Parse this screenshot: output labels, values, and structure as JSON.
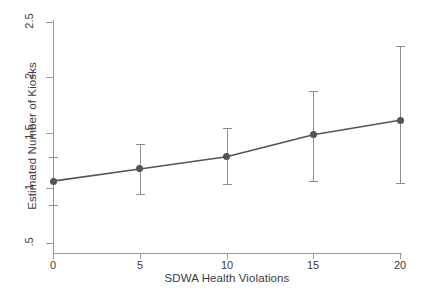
{
  "chart_data": {
    "type": "line",
    "title": "",
    "xlabel": "SDWA Health Violations",
    "ylabel": "Estimated Number of Kiosks",
    "x": [
      0,
      5,
      10,
      15,
      20
    ],
    "values": [
      1.06,
      1.17,
      1.28,
      1.48,
      1.61
    ],
    "series": [
      {
        "name": "Estimated Number of Kiosks",
        "values": [
          1.06,
          1.17,
          1.28,
          1.48,
          1.61
        ],
        "ci_lower": [
          0.84,
          0.94,
          1.03,
          1.06,
          1.04
        ],
        "ci_upper": [
          1.28,
          1.4,
          1.54,
          1.88,
          2.28
        ]
      }
    ],
    "xticklabels": [
      "0",
      "5",
      "10",
      "15",
      "20"
    ],
    "yticklabels": [
      "2.5",
      "2",
      "1.5",
      "1",
      ".5"
    ],
    "ytickvalues": [
      2.5,
      2,
      1.5,
      1,
      0.5
    ],
    "xlim": [
      0,
      20
    ],
    "ylim": [
      0.5,
      2.5
    ],
    "grid": false,
    "legend": "none",
    "marker": "filled-circle",
    "errorbars": "vertical-capped",
    "colors": {
      "line": "#545454",
      "marker": "#545454",
      "errorbar": "#8e8e8e",
      "axis": "#9a9a9a",
      "text": "#3c3c3c",
      "background": "#ffffff"
    }
  }
}
